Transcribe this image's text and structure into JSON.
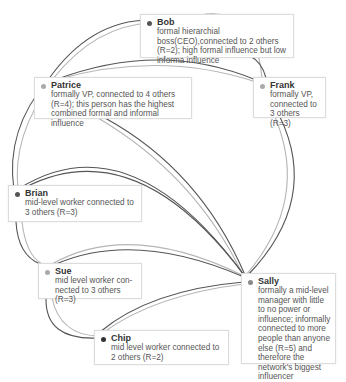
{
  "nodes": {
    "bob": {
      "name": "Bob",
      "desc": "formal hierarchial boss(CEO),connected to 2 others (R=2); high formal influence but low informa influence",
      "dot": "#555555"
    },
    "patrice": {
      "name": "Patrice",
      "desc": "formally VP, connected to 4 others (R=4); this person has the highest combined formal and informal influence",
      "dot": "#aaaaaa"
    },
    "frank": {
      "name": "Frank",
      "desc": "formally VP, connected to 3 others (R=3)",
      "dot": "#aaaaaa"
    },
    "brian": {
      "name": "Brian",
      "desc": "mid-level worker connected to 3 others (R=3)",
      "dot": "#555555"
    },
    "sue": {
      "name": "Sue",
      "desc": "mid level worker con-nected to 3 others (R=3)",
      "dot": "#aaaaaa"
    },
    "chip": {
      "name": "Chip",
      "desc": "mid level worker connected to 2 others (R=2)",
      "dot": "#333333"
    },
    "sally": {
      "name": "Sally",
      "desc": "formally a mid-level manager with little to no power or influence; informally connected to more people than anyone else (R=5) and therefore the network's biggest influencer",
      "dot": "#888888"
    }
  },
  "edges": [
    [
      "bob",
      "patrice"
    ],
    [
      "bob",
      "frank"
    ],
    [
      "patrice",
      "frank"
    ],
    [
      "patrice",
      "brian"
    ],
    [
      "patrice",
      "sally"
    ],
    [
      "frank",
      "sally"
    ],
    [
      "brian",
      "sue"
    ],
    [
      "brian",
      "sally"
    ],
    [
      "sue",
      "chip"
    ],
    [
      "sue",
      "sally"
    ],
    [
      "chip",
      "sally"
    ]
  ],
  "colors": {
    "edge_dark": "#555555",
    "edge_light": "#b5b5b5",
    "border": "#dcdcdc"
  }
}
